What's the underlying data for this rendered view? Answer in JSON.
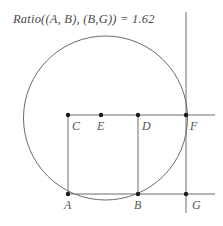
{
  "figure": {
    "width": 223,
    "height": 226,
    "background": "#ffffff",
    "caption": "Ratio((A, B), (B,G)) = 1.62"
  },
  "style": {
    "line_color": "#6e6e6e",
    "circle_color": "#6b6b6b",
    "point_color": "#1a1a1a",
    "label_color": "#555555",
    "caption_color": "#4a4a4a",
    "line_width": 1,
    "point_radius": 2.2
  },
  "chart_data": {
    "type": "diagram",
    "title": "Ratio((A, B), (B,G)) = 1.62",
    "ratio_value": 1.62,
    "circle": {
      "cx": 105.5,
      "cy": 118,
      "r": 82
    },
    "points": [
      {
        "id": "A",
        "x": 68,
        "y": 194,
        "label": "A",
        "label_x": 64,
        "label_y": 198
      },
      {
        "id": "B",
        "x": 138,
        "y": 194,
        "label": "B",
        "label_x": 134,
        "label_y": 198
      },
      {
        "id": "C",
        "x": 68,
        "y": 115,
        "label": "C",
        "label_x": 72,
        "label_y": 119
      },
      {
        "id": "D",
        "x": 138,
        "y": 115,
        "label": "D",
        "label_x": 142,
        "label_y": 119
      },
      {
        "id": "E",
        "x": 101,
        "y": 115,
        "label": "E",
        "label_x": 97,
        "label_y": 119
      },
      {
        "id": "F",
        "x": 186,
        "y": 115,
        "label": "F",
        "label_x": 190,
        "label_y": 119
      },
      {
        "id": "G",
        "x": 186,
        "y": 194,
        "label": "G",
        "label_x": 192,
        "label_y": 198
      }
    ],
    "segments": [
      {
        "name": "top-horizontal-line",
        "x1": 68,
        "y1": 115,
        "x2": 215,
        "y2": 115
      },
      {
        "name": "bottom-horizontal-line",
        "x1": 68,
        "y1": 194,
        "x2": 215,
        "y2": 194
      },
      {
        "name": "left-vertical-CA",
        "x1": 68,
        "y1": 115,
        "x2": 68,
        "y2": 194
      },
      {
        "name": "middle-vertical-DB",
        "x1": 138,
        "y1": 115,
        "x2": 138,
        "y2": 194
      },
      {
        "name": "right-vertical-FG",
        "x1": 186,
        "y1": 12,
        "x2": 186,
        "y2": 213
      }
    ]
  }
}
